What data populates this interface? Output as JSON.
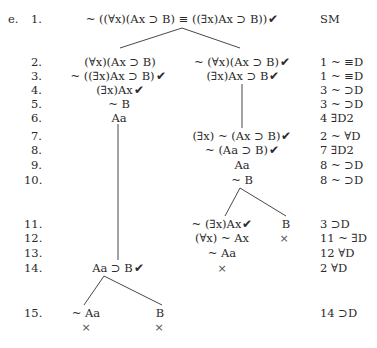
{
  "exercise_label": "e.",
  "check_mark": "✔",
  "closed_mark": "×",
  "rows": [
    {
      "n": "1.",
      "left": "~ ((∀x)(Ax ⊃ B) ≡ ((∃x)Ax ⊃ B))",
      "left_checked": true,
      "justification": "SM"
    },
    {
      "n": "2.",
      "left": "(∀x)(Ax ⊃ B)",
      "left_checked": false,
      "right": "~ (∀x)(Ax ⊃ B)",
      "right_checked": true,
      "justification": "1 ~ ≡D"
    },
    {
      "n": "3.",
      "left": "~ ((∃x)Ax ⊃ B)",
      "left_checked": true,
      "right": "(∃x)Ax ⊃ B",
      "right_checked": true,
      "justification": "1 ~ ≡D"
    },
    {
      "n": "4.",
      "left": "(∃x)Ax",
      "left_checked": true,
      "justification": "3 ~ ⊃D"
    },
    {
      "n": "5.",
      "left": "~ B",
      "justification": "3 ~ ⊃D"
    },
    {
      "n": "6.",
      "left": "Aa",
      "justification": "4 ∃D2"
    },
    {
      "n": "7.",
      "right": "(∃x) ~ (Ax ⊃ B)",
      "right_checked": true,
      "justification": "2 ~ ∀D"
    },
    {
      "n": "8.",
      "right": "~ (Aa ⊃ B)",
      "right_checked": true,
      "justification": "7 ∃D2"
    },
    {
      "n": "9.",
      "right": "Aa",
      "justification": "8 ~ ⊃D"
    },
    {
      "n": "10.",
      "right": "~ B",
      "justification": "8 ~ ⊃D"
    },
    {
      "n": "11.",
      "right_a": "~ (∃x)Ax",
      "right_a_checked": true,
      "right_b": "B",
      "justification": "3 ⊃D"
    },
    {
      "n": "12.",
      "right_a": "(∀x) ~ Ax",
      "right_b_closed": true,
      "justification": "11 ~ ∃D"
    },
    {
      "n": "13.",
      "right_a": "~ Aa",
      "justification": "12 ∀D"
    },
    {
      "n": "14.",
      "left": "Aa ⊃ B",
      "left_checked": true,
      "right_a_closed": true,
      "justification": "2 ∀D"
    },
    {
      "n": "15.",
      "left_a": "~ Aa",
      "left_b": "B",
      "left_a_closed": true,
      "left_b_closed": true,
      "justification": "14 ⊃D"
    }
  ]
}
